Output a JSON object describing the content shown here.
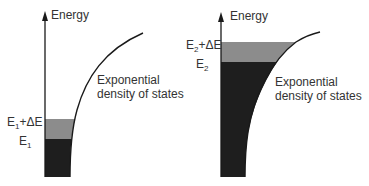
{
  "colors": {
    "axis": "#1a1a1a",
    "filled_dark": "#1e1e1e",
    "filled_band": "#8c8c8c",
    "curve": "#1a1a1a",
    "text": "#333333"
  },
  "panels": [
    {
      "axis_label": "Energy",
      "upper_level": {
        "base": "E",
        "subscript": "1",
        "suffix": "+ΔE"
      },
      "lower_level": {
        "base": "E",
        "subscript": "1"
      },
      "curve_label_line1": "Exponential",
      "curve_label_line2": "density of states"
    },
    {
      "axis_label": "Energy",
      "upper_level": {
        "base": "E",
        "subscript": "2",
        "suffix": "+ΔE"
      },
      "lower_level": {
        "base": "E",
        "subscript": "2"
      },
      "curve_label_line1": "Exponential",
      "curve_label_line2": "density of states"
    }
  ]
}
